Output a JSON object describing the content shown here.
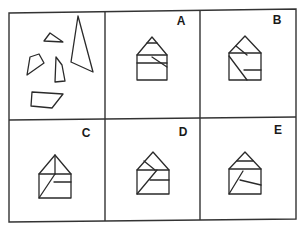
{
  "puzzle": {
    "type": "figure-assembly",
    "colors": {
      "ink": "#2a2a2a",
      "background": "#ffffff",
      "grid": "#333333"
    },
    "grid": {
      "outer": [
        [
          9,
          13
        ],
        [
          296,
          9
        ],
        [
          296,
          219
        ],
        [
          9,
          222
        ]
      ],
      "vertical_dividers": [
        [
          [
            105,
            12
          ],
          [
            105,
            221
          ]
        ],
        [
          [
            200,
            10
          ],
          [
            200,
            220
          ]
        ]
      ],
      "horizontal_divider": [
        [
          9,
          120
        ],
        [
          296,
          117
        ]
      ]
    },
    "question_panel": {
      "name": "pieces",
      "pieces": [
        {
          "name": "small-triangle",
          "points": [
            [
              44,
              41
            ],
            [
              50,
              33
            ],
            [
              63,
              42
            ]
          ]
        },
        {
          "name": "left-quadrilateral",
          "points": [
            [
              27,
              75
            ],
            [
              30,
              57
            ],
            [
              39,
              54
            ],
            [
              44,
              63
            ]
          ]
        },
        {
          "name": "middle-quadrilateral",
          "points": [
            [
              55,
              82
            ],
            [
              56,
              57
            ],
            [
              62,
              65
            ],
            [
              65,
              81
            ]
          ]
        },
        {
          "name": "right-triangle",
          "points": [
            [
              78,
              16
            ],
            [
              71,
              62
            ],
            [
              93,
              72
            ]
          ]
        },
        {
          "name": "bottom-quadrilateral",
          "points": [
            [
              31,
              106
            ],
            [
              32,
              92
            ],
            [
              63,
              94
            ],
            [
              52,
              108
            ]
          ]
        }
      ]
    },
    "options": [
      {
        "label": "A",
        "label_pos": [
          181,
          25
        ],
        "outline": [
          [
            137,
            80
          ],
          [
            137,
            55
          ],
          [
            152,
            37
          ],
          [
            167,
            55
          ],
          [
            167,
            80
          ]
        ],
        "lines": [
          [
            [
              147,
              43
            ],
            [
              157,
              43
            ]
          ],
          [
            [
              137,
              55
            ],
            [
              167,
              55
            ]
          ],
          [
            [
              137,
              63
            ],
            [
              167,
              63
            ]
          ],
          [
            [
              152,
              57
            ],
            [
              167,
              67
            ]
          ]
        ]
      },
      {
        "label": "B",
        "label_pos": [
          277,
          24
        ],
        "outline": [
          [
            229,
            80
          ],
          [
            229,
            53
          ],
          [
            245,
            36
          ],
          [
            261,
            53
          ],
          [
            261,
            80
          ]
        ],
        "lines": [
          [
            [
              236,
              46
            ],
            [
              247,
              55
            ]
          ],
          [
            [
              229,
              53
            ],
            [
              261,
              53
            ]
          ],
          [
            [
              229,
              56
            ],
            [
              247,
              80
            ]
          ],
          [
            [
              244,
              70
            ],
            [
              261,
              70
            ]
          ]
        ]
      },
      {
        "label": "C",
        "label_pos": [
          86,
          137
        ],
        "outline": [
          [
            39,
            198
          ],
          [
            39,
            174
          ],
          [
            55,
            155
          ],
          [
            71,
            174
          ],
          [
            71,
            198
          ]
        ],
        "lines": [
          [
            [
              39,
              174
            ],
            [
              71,
              174
            ]
          ],
          [
            [
              55,
              155
            ],
            [
              55,
              174
            ]
          ],
          [
            [
              54,
              182
            ],
            [
              71,
              182
            ]
          ],
          [
            [
              39,
              198
            ],
            [
              55,
              174
            ]
          ]
        ]
      },
      {
        "label": "D",
        "label_pos": [
          183,
          136
        ],
        "outline": [
          [
            137,
            194
          ],
          [
            137,
            170
          ],
          [
            153,
            152
          ],
          [
            169,
            170
          ],
          [
            169,
            194
          ]
        ],
        "lines": [
          [
            [
              144,
              161
            ],
            [
              155,
              170
            ]
          ],
          [
            [
              137,
              170
            ],
            [
              169,
              170
            ]
          ],
          [
            [
              137,
              194
            ],
            [
              157,
              170
            ]
          ],
          [
            [
              150,
              180
            ],
            [
              169,
              180
            ]
          ]
        ]
      },
      {
        "label": "E",
        "label_pos": [
          278,
          134
        ],
        "outline": [
          [
            229,
            194
          ],
          [
            229,
            169
          ],
          [
            245,
            152
          ],
          [
            261,
            169
          ],
          [
            261,
            194
          ]
        ],
        "lines": [
          [
            [
              237,
              161
            ],
            [
              253,
              161
            ]
          ],
          [
            [
              229,
              169
            ],
            [
              261,
              169
            ]
          ],
          [
            [
              229,
              194
            ],
            [
              243,
              171
            ]
          ],
          [
            [
              240,
              180
            ],
            [
              261,
              185
            ]
          ]
        ]
      }
    ]
  }
}
